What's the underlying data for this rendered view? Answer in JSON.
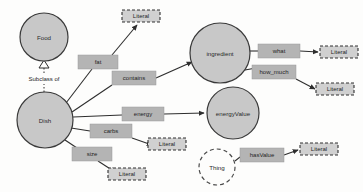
{
  "diagram": {
    "colors": {
      "node_fill": "#c8c8c8",
      "node_stroke": "#3a3a3a",
      "edge_box_fill": "#b4b4b4",
      "literal_fill": "#d0d0d0",
      "background": "#fdfdfc"
    },
    "nodes": [
      {
        "id": "food",
        "label": "Food",
        "shape": "circle",
        "cx": 44,
        "cy": 37,
        "r": 24
      },
      {
        "id": "dish",
        "label": "Dish",
        "shape": "circle",
        "cx": 45,
        "cy": 120,
        "r": 28
      },
      {
        "id": "ingredient",
        "label": "ingredient",
        "shape": "circle",
        "cx": 220,
        "cy": 53,
        "r": 30
      },
      {
        "id": "energyvalue",
        "label": "energyValue",
        "shape": "circle",
        "cx": 233,
        "cy": 113,
        "r": 26
      },
      {
        "id": "thing",
        "label": "Thing",
        "shape": "dashed-circle",
        "cx": 217,
        "cy": 167,
        "r": 18
      }
    ],
    "literals": [
      {
        "id": "literal-fat",
        "label": "Literal",
        "x": 122,
        "y": 10,
        "w": 38,
        "h": 12
      },
      {
        "id": "literal-what",
        "label": "Literal",
        "x": 320,
        "y": 46,
        "w": 38,
        "h": 12
      },
      {
        "id": "literal-howmuch",
        "label": "Literal",
        "x": 316,
        "y": 83,
        "w": 38,
        "h": 12
      },
      {
        "id": "literal-carbs",
        "label": "Literal",
        "x": 148,
        "y": 138,
        "w": 38,
        "h": 12
      },
      {
        "id": "literal-size",
        "label": "Literal",
        "x": 108,
        "y": 168,
        "w": 38,
        "h": 12
      },
      {
        "id": "literal-hasvalue",
        "label": "Literal",
        "x": 300,
        "y": 143,
        "w": 38,
        "h": 12
      }
    ],
    "edge_labels": [
      {
        "id": "fat",
        "label": "fat",
        "x": 78,
        "y": 55,
        "w": 40,
        "h": 14
      },
      {
        "id": "contains",
        "label": "contains",
        "x": 112,
        "y": 78,
        "w": 44,
        "h": 14
      },
      {
        "id": "energy",
        "label": "energy",
        "x": 122,
        "y": 108,
        "w": 42,
        "h": 14
      },
      {
        "id": "carbs",
        "label": "carbs",
        "x": 90,
        "y": 126,
        "w": 42,
        "h": 14
      },
      {
        "id": "size",
        "label": "size",
        "x": 72,
        "y": 148,
        "w": 40,
        "h": 14
      },
      {
        "id": "what",
        "label": "what",
        "x": 258,
        "y": 44,
        "w": 42,
        "h": 14
      },
      {
        "id": "how_much",
        "label": "how_much",
        "x": 252,
        "y": 65,
        "w": 44,
        "h": 14
      },
      {
        "id": "hasValue",
        "label": "hasValue",
        "x": 240,
        "y": 150,
        "w": 44,
        "h": 14
      }
    ],
    "relations": [
      {
        "id": "subclass",
        "label": "Subclass of",
        "from": "dish",
        "to": "food",
        "style": "dotted-hollow-triangle",
        "x": 44,
        "y": 78
      }
    ],
    "edges": [
      {
        "id": "dish-fat-literal",
        "from": "dish",
        "via": "fat",
        "to": "literal-fat"
      },
      {
        "id": "dish-contains-ingredient",
        "from": "dish",
        "via": "contains",
        "to": "ingredient"
      },
      {
        "id": "dish-energy-energyvalue",
        "from": "dish",
        "via": "energy",
        "to": "energyvalue"
      },
      {
        "id": "dish-carbs-literal",
        "from": "dish",
        "via": "carbs",
        "to": "literal-carbs"
      },
      {
        "id": "dish-size-literal",
        "from": "dish",
        "via": "size",
        "to": "literal-size"
      },
      {
        "id": "ingredient-what-literal",
        "from": "ingredient",
        "via": "what",
        "to": "literal-what"
      },
      {
        "id": "ingredient-howmuch-literal",
        "from": "ingredient",
        "via": "how_much",
        "to": "literal-howmuch"
      },
      {
        "id": "thing-hasvalue-literal",
        "from": "thing",
        "via": "hasValue",
        "to": "literal-hasvalue"
      }
    ]
  }
}
